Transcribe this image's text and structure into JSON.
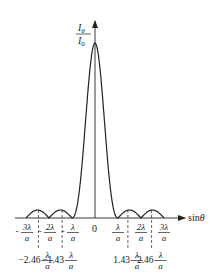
{
  "diagram": {
    "y_axis_label": {
      "numerator": "I",
      "numerator_sub": "θ",
      "denominator": "I",
      "denominator_sub": "0"
    },
    "x_axis_label": "sinθ",
    "origin_label": "0",
    "colors": {
      "line": "#222222",
      "background": "#ffffff"
    },
    "zero_tick_labels": [
      {
        "coef": "-3",
        "value": -3,
        "text": "-3λ/a"
      },
      {
        "coef": "-2",
        "value": -2,
        "text": "-2λ/a"
      },
      {
        "coef": "-",
        "value": -1,
        "text": "-λ/a"
      },
      {
        "coef": "",
        "value": 1,
        "text": "λ/a"
      },
      {
        "coef": "2",
        "value": 2,
        "text": "2λ/a"
      },
      {
        "coef": "3",
        "value": 3,
        "text": "3λ/a"
      }
    ],
    "secondary_max_labels": [
      {
        "coef": "-2.46",
        "value": -2.46
      },
      {
        "coef": "-1.43",
        "value": -1.43
      },
      {
        "coef": "1.43",
        "value": 1.43
      },
      {
        "coef": "2.46",
        "value": 2.46
      }
    ],
    "fraction_symbol": {
      "num": "λ",
      "den": "a"
    }
  }
}
